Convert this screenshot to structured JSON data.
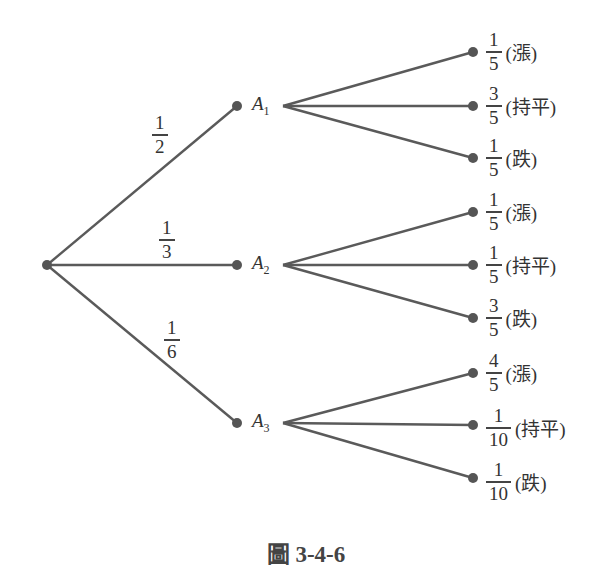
{
  "figure": {
    "caption": "圖 3-4-6",
    "root": {
      "id": "root"
    },
    "first_level": [
      {
        "name": "A",
        "sub": "1",
        "prob": {
          "num": "1",
          "den": "2"
        },
        "children": [
          {
            "prob": {
              "num": "1",
              "den": "5"
            },
            "label": "(漲)"
          },
          {
            "prob": {
              "num": "3",
              "den": "5"
            },
            "label": "(持平)"
          },
          {
            "prob": {
              "num": "1",
              "den": "5"
            },
            "label": "(跌)"
          }
        ]
      },
      {
        "name": "A",
        "sub": "2",
        "prob": {
          "num": "1",
          "den": "3"
        },
        "children": [
          {
            "prob": {
              "num": "1",
              "den": "5"
            },
            "label": "(漲)"
          },
          {
            "prob": {
              "num": "1",
              "den": "5"
            },
            "label": "(持平)"
          },
          {
            "prob": {
              "num": "3",
              "den": "5"
            },
            "label": "(跌)"
          }
        ]
      },
      {
        "name": "A",
        "sub": "3",
        "prob": {
          "num": "1",
          "den": "6"
        },
        "children": [
          {
            "prob": {
              "num": "4",
              "den": "5"
            },
            "label": "(漲)"
          },
          {
            "prob": {
              "num": "1",
              "den": "10"
            },
            "label": "(持平)"
          },
          {
            "prob": {
              "num": "1",
              "den": "10"
            },
            "label": "(跌)"
          }
        ]
      }
    ]
  }
}
